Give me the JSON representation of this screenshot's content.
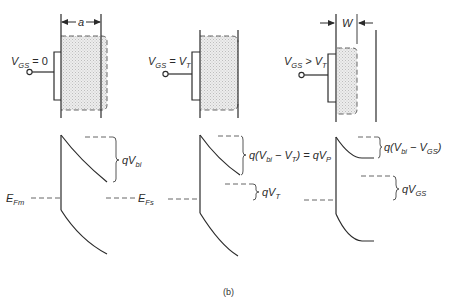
{
  "figure": {
    "caption": "(b)",
    "panels": [
      {
        "id": "vgs-zero",
        "bias_label": {
          "v": "V",
          "sub": "GS",
          "rel": " = 0"
        },
        "dimension_label": "a",
        "band": {
          "barrier_label": {
            "pre": "qV",
            "sub": "bi",
            "post": ""
          },
          "fermi_metal_label": {
            "e": "E",
            "sub": "Fm"
          },
          "fermi_semi_label": {
            "e": "E",
            "sub": "Fs"
          }
        }
      },
      {
        "id": "vgs-vt",
        "bias_label": {
          "v": "V",
          "sub": "GS",
          "rel": " = V",
          "sub2": "T"
        },
        "band": {
          "barrier_label": {
            "text1": "q(V",
            "sub1": "bi",
            "text2": " − V",
            "sub2": "T",
            "text3": ") = qV",
            "sub3": "P"
          },
          "shift_label": {
            "pre": "qV",
            "sub": "T"
          }
        }
      },
      {
        "id": "vgs-gt-vt",
        "bias_label": {
          "v": "V",
          "sub": "GS",
          "rel": " > V",
          "sub2": "T"
        },
        "dimension_label": "W",
        "band": {
          "barrier_label": {
            "text1": "q(V",
            "sub1": "bi",
            "text2": " − V",
            "sub2": "GS",
            "text3": ")"
          },
          "shift_label": {
            "pre": "qV",
            "sub": "GS"
          }
        }
      }
    ]
  },
  "colors": {
    "ink": "#2b2b2b",
    "depletion_fill": "#e6e6e6",
    "background": "#ffffff"
  }
}
